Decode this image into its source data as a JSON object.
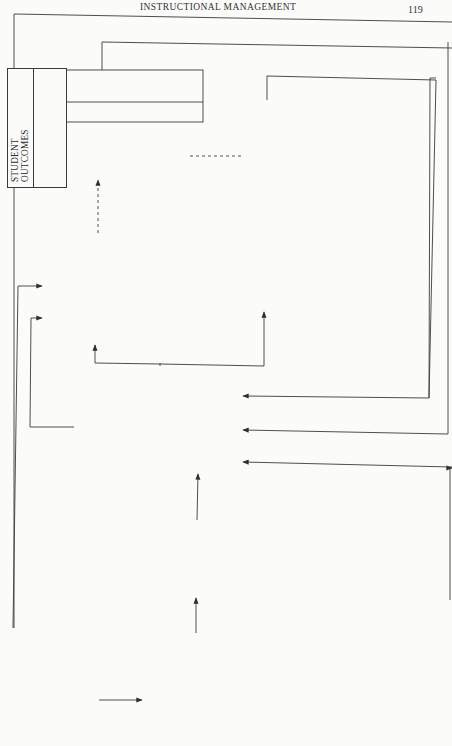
{
  "page": {
    "running_head": "INSTRUCTIONAL MANAGEMENT",
    "page_number": "119"
  },
  "boxes": {
    "community_context": {
      "title": [
        "COMMUNITY",
        "CONTEXT"
      ],
      "lines": [
        "(a) Low SES",
        "(b) Transient",
        "      population",
        "(c) Declining",
        "      economy"
      ]
    },
    "principal_characteristics": {
      "title": [
        "PRINCIPAL",
        "CHARACTERISTICS"
      ],
      "lines": [
        "Experience:",
        "   22 years",
        "Training:",
        "   MA in reading",
        "   instruction",
        "Beliefs:",
        "   democratic;",
        "   egalitarian"
      ]
    },
    "institutional_context": {
      "title": [
        "INSTITUTIONAL",
        "CONTEXT"
      ],
      "lines": [
        "(a) Centralization",
        "      effort from",
        "      district",
        "(b) State and federal",
        "      programmatic",
        "      and funding",
        "      regulations"
      ]
    },
    "school_plan": {
      "title": [
        "PRINCIPAL'S",
        "SCHOOL PLAN"
      ],
      "lines": [
        "5-year plan to:",
        "(a) Raise test",
        "      scores",
        "(b) Decrease",
        "      student",
        "      violence",
        "(c) Improve",
        "      facilities"
      ]
    },
    "management_behaviour": {
      "title": [
        "PRINCIPAL'S",
        "MANAGEMENT",
        "BEHAVIOUR"
      ],
      "lines": [
        "Mode:",
        "   facilitative",
        "   and catalytic",
        "Activities:",
        "(a) Staffing",
        "(b) Communi-",
        "      cating",
        "(c) Monitoring"
      ]
    },
    "school_climate": {
      "title": [
        "SCHOOL CLIMATE"
      ],
      "lines": [
        "(factors affecting",
        "student readiness for",
        "learning)",
        "",
        "(a) Physical plant",
        "(b) Safety",
        "(c) Staff cooperation",
        "(d) Student",
        "      compatibility",
        "(e) Staff interest in",
        "      whole child",
        "(f) School/",
        "      community",
        "      relations"
      ]
    },
    "student_outcomes": {
      "title": [
        "STUDENT",
        "OUTCOMES"
      ],
      "lines": [
        "(a) Self-reliance",
        "(b) Productive",
        "      citizenry",
        "(c) Minimum",
        "      competence",
        "      communication",
        "      and computation",
        "      skills",
        "(d) Achievement",
        "      commensurate",
        "      with ability"
      ]
    },
    "instructional_organization": {
      "title": [
        "INSTRUCTIONAL",
        "ORGANIZATION"
      ],
      "lines": [
        "(a) Language",
        "      development",
        "      kindergarten",
        "(b) Multi-approach",
        "      reading",
        "      programme",
        "(c) Child-centred",
        "      instruction",
        "(d) 3R emphasis at",
        "      all levels",
        "(e) Coordinated",
        "      pullout pro-",
        "      gramme to meet",
        "      individual needs"
      ]
    }
  },
  "connections": [
    {
      "from": "community_context",
      "to": "principal_characteristics",
      "style": "solid-arrow"
    },
    {
      "from": "community_context",
      "to": "school_climate",
      "style": "solid-arrow"
    },
    {
      "from": "principal_characteristics",
      "to": "school_plan",
      "style": "solid-arrow"
    },
    {
      "from": "school_plan",
      "to": "management_behaviour",
      "style": "solid-arrow"
    },
    {
      "from": "management_behaviour",
      "to": "school_climate",
      "style": "solid-arrow"
    },
    {
      "from": "management_behaviour",
      "to": "instructional_organization",
      "style": "solid-arrow"
    },
    {
      "from": "school_climate",
      "to": "student_outcomes",
      "style": "dashed-arrow"
    },
    {
      "from": "instructional_organization",
      "to": "student_outcomes",
      "style": "dashed-line"
    },
    {
      "from": "student_outcomes",
      "to": "management_behaviour",
      "style": "feedback-loop"
    },
    {
      "from": "instructional_organization",
      "to": "management_behaviour",
      "style": "feedback-loop"
    },
    {
      "from": "school_climate",
      "to": "management_behaviour",
      "style": "feedback-loop"
    },
    {
      "from": "institutional_context",
      "to": "management_behaviour",
      "style": "solid-arrow"
    }
  ]
}
